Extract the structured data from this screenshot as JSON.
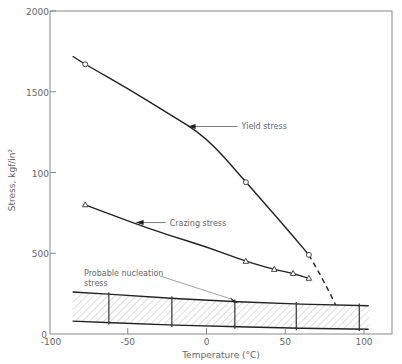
{
  "chart_data": {
    "type": "line",
    "title": "",
    "xlabel": "Temperature (°C)",
    "ylabel": "Stress, kgf/in²",
    "xlim": [
      -100,
      110
    ],
    "ylim": [
      0,
      2000
    ],
    "x_ticks": [
      -100,
      -50,
      0,
      50,
      100
    ],
    "x_tick_labels": [
      "-100",
      "-50",
      "0",
      "50",
      "100"
    ],
    "y_ticks": [
      0,
      500,
      1000,
      1500,
      2000
    ],
    "y_tick_labels": [
      "0",
      "500",
      "100",
      "1500",
      "2000"
    ],
    "grid": false,
    "series": [
      {
        "name": "Yield stress",
        "marker": "circle",
        "line": [
          [
            -85,
            1720
          ],
          [
            -77,
            1670
          ],
          [
            -50,
            1520
          ],
          [
            -25,
            1370
          ],
          [
            0,
            1220
          ],
          [
            25,
            940
          ],
          [
            45,
            720
          ],
          [
            65,
            490
          ]
        ],
        "markers": [
          [
            -77,
            1670
          ],
          [
            25,
            940
          ],
          [
            65,
            490
          ]
        ],
        "extrapolation_dashed": [
          [
            65,
            490
          ],
          [
            72,
            370
          ],
          [
            78,
            260
          ],
          [
            82,
            180
          ]
        ]
      },
      {
        "name": "Crazing stress",
        "marker": "triangle",
        "line": [
          [
            -77,
            800
          ],
          [
            -50,
            700
          ],
          [
            -25,
            615
          ],
          [
            0,
            540
          ],
          [
            25,
            450
          ],
          [
            43,
            400
          ],
          [
            55,
            375
          ],
          [
            65,
            345
          ]
        ],
        "markers": [
          [
            -77,
            800
          ],
          [
            25,
            450
          ],
          [
            43,
            400
          ],
          [
            55,
            375
          ],
          [
            65,
            345
          ]
        ]
      },
      {
        "name": "Probable nucleation stress",
        "type": "band",
        "upper": [
          [
            -85,
            260
          ],
          [
            -60,
            245
          ],
          [
            -20,
            220
          ],
          [
            20,
            200
          ],
          [
            60,
            185
          ],
          [
            103,
            175
          ]
        ],
        "lower": [
          [
            -85,
            80
          ],
          [
            -60,
            70
          ],
          [
            -20,
            55
          ],
          [
            20,
            45
          ],
          [
            60,
            35
          ],
          [
            103,
            30
          ]
        ],
        "error_bars_x": [
          -62,
          -22,
          18,
          57,
          97
        ]
      }
    ],
    "annotations": [
      {
        "text": "Yield stress",
        "arrow_to": [
          -12,
          1285
        ]
      },
      {
        "text": "Crazing stress",
        "arrow_to": [
          -45,
          690
        ]
      },
      {
        "text": "Probable nucleation",
        "text2": "stress",
        "arrow_to": [
          20,
          190
        ]
      }
    ]
  }
}
